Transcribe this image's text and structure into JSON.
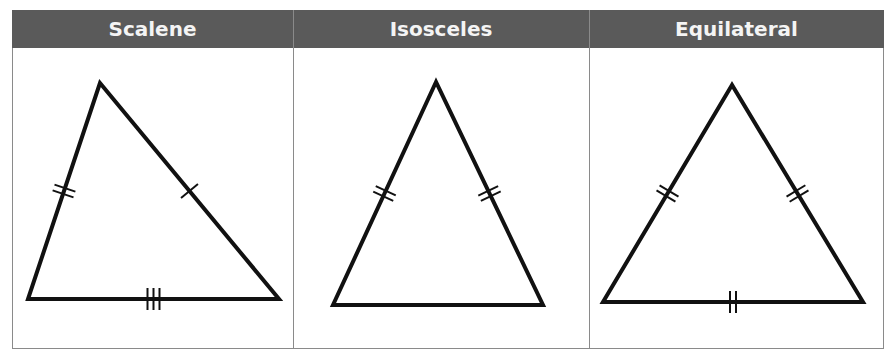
{
  "table": {
    "columns": [
      {
        "title": "Scalene",
        "triangle": {
          "vertices": [
            [
              100,
              83
            ],
            [
              28,
              299
            ],
            [
              279,
              299
            ]
          ],
          "side_marks": {
            "left": 2,
            "right": 1,
            "bottom": 3
          }
        }
      },
      {
        "title": "Isosceles",
        "triangle": {
          "vertices": [
            [
              436,
              82
            ],
            [
              333,
              305
            ],
            [
              543,
              305
            ]
          ],
          "side_marks": {
            "left": 2,
            "right": 2,
            "bottom": 0
          }
        }
      },
      {
        "title": "Equilateral",
        "triangle": {
          "vertices": [
            [
              732,
              85
            ],
            [
              603,
              302
            ],
            [
              863,
              302
            ]
          ],
          "side_marks": {
            "left": 2,
            "right": 2,
            "bottom": 2
          }
        }
      }
    ]
  },
  "colors": {
    "header_bg": "#5a5a5a",
    "header_text": "#f4f4f4",
    "border": "#8a8a8a",
    "stroke": "#111111"
  }
}
